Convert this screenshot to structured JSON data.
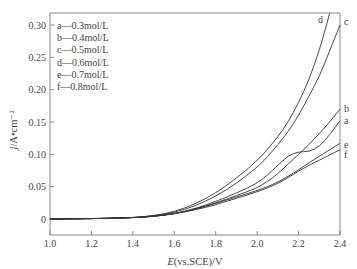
{
  "chart_data": {
    "type": "line",
    "title": "",
    "xlabel": "E(vs.SCE)/V",
    "ylabel": "j/A•cm⁻²",
    "xlim": [
      1.0,
      2.4
    ],
    "ylim": [
      -0.025,
      0.32
    ],
    "xticks": [
      1.0,
      1.2,
      1.4,
      1.6,
      1.8,
      2.0,
      2.2,
      2.4
    ],
    "xtick_labels": [
      "1.0",
      "1.2",
      "1.4",
      "1.6",
      "1.8",
      "2.0",
      "2.2",
      "2.4"
    ],
    "yticks": [
      0,
      0.05,
      0.1,
      0.15,
      0.2,
      0.25,
      0.3
    ],
    "ytick_labels": [
      "0",
      "0.05",
      "0.10",
      "0.15",
      "0.20",
      "0.25",
      "0.30"
    ],
    "grid": false,
    "legend_position": "upper left",
    "legend": [
      "a—0.3mol/L",
      "b—0.4mol/L",
      "c—0.5mol/L",
      "d—0.6mol/L",
      "e—0.7mol/L",
      "f—0.8mol/L"
    ],
    "series": [
      {
        "name": "a",
        "label": "0.3mol/L",
        "x": [
          1.0,
          1.2,
          1.4,
          1.5,
          1.6,
          1.7,
          1.8,
          1.9,
          2.0,
          2.05,
          2.1,
          2.15,
          2.2,
          2.25,
          2.3,
          2.35,
          2.4
        ],
        "y": [
          0,
          0.0005,
          0.002,
          0.004,
          0.008,
          0.016,
          0.027,
          0.04,
          0.055,
          0.068,
          0.083,
          0.098,
          0.104,
          0.104,
          0.112,
          0.13,
          0.152
        ]
      },
      {
        "name": "b",
        "label": "0.4mol/L",
        "x": [
          1.0,
          1.2,
          1.4,
          1.5,
          1.6,
          1.7,
          1.8,
          1.9,
          2.0,
          2.05,
          2.1,
          2.15,
          2.2,
          2.25,
          2.3,
          2.35,
          2.4
        ],
        "y": [
          0,
          0.0005,
          0.002,
          0.004,
          0.008,
          0.015,
          0.025,
          0.036,
          0.048,
          0.058,
          0.07,
          0.085,
          0.1,
          0.115,
          0.132,
          0.15,
          0.17
        ]
      },
      {
        "name": "c",
        "label": "0.5mol/L",
        "x": [
          1.0,
          1.2,
          1.4,
          1.5,
          1.6,
          1.7,
          1.8,
          1.9,
          2.0,
          2.05,
          2.1,
          2.15,
          2.2,
          2.25,
          2.3,
          2.35,
          2.4
        ],
        "y": [
          0,
          0.0005,
          0.002,
          0.005,
          0.01,
          0.02,
          0.035,
          0.055,
          0.08,
          0.096,
          0.115,
          0.135,
          0.16,
          0.19,
          0.22,
          0.26,
          0.3
        ]
      },
      {
        "name": "d",
        "label": "0.6mol/L",
        "x": [
          1.0,
          1.2,
          1.4,
          1.5,
          1.6,
          1.7,
          1.8,
          1.9,
          2.0,
          2.05,
          2.1,
          2.15,
          2.2,
          2.25,
          2.3,
          2.35
        ],
        "y": [
          0,
          0.0005,
          0.002,
          0.005,
          0.011,
          0.023,
          0.04,
          0.063,
          0.09,
          0.108,
          0.127,
          0.15,
          0.18,
          0.215,
          0.26,
          0.318
        ]
      },
      {
        "name": "e",
        "label": "0.7mol/L",
        "x": [
          1.0,
          1.2,
          1.4,
          1.5,
          1.6,
          1.7,
          1.8,
          1.9,
          2.0,
          2.05,
          2.1,
          2.15,
          2.2,
          2.25,
          2.3,
          2.35,
          2.4
        ],
        "y": [
          0,
          0.0005,
          0.002,
          0.004,
          0.008,
          0.015,
          0.024,
          0.034,
          0.044,
          0.05,
          0.057,
          0.066,
          0.076,
          0.087,
          0.097,
          0.107,
          0.117
        ]
      },
      {
        "name": "f",
        "label": "0.8mol/L",
        "x": [
          1.0,
          1.2,
          1.4,
          1.5,
          1.6,
          1.7,
          1.8,
          1.9,
          2.0,
          2.05,
          2.1,
          2.15,
          2.2,
          2.25,
          2.3,
          2.35,
          2.4
        ],
        "y": [
          0,
          0.0005,
          0.002,
          0.004,
          0.008,
          0.014,
          0.022,
          0.032,
          0.042,
          0.048,
          0.055,
          0.064,
          0.074,
          0.083,
          0.091,
          0.099,
          0.107
        ]
      }
    ],
    "curve_end_labels": [
      {
        "name": "d",
        "text": "d"
      },
      {
        "name": "c",
        "text": "c"
      },
      {
        "name": "b",
        "text": "b"
      },
      {
        "name": "a",
        "text": "a"
      },
      {
        "name": "e",
        "text": "e"
      },
      {
        "name": "f",
        "text": "f"
      }
    ]
  }
}
